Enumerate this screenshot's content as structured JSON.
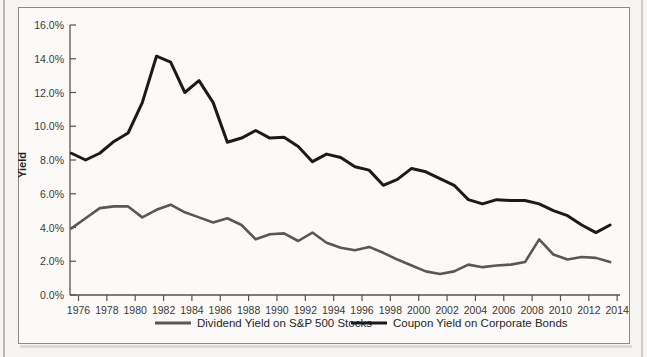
{
  "chart_data": {
    "type": "line",
    "title": "",
    "xlabel": "",
    "ylabel": "Yield",
    "xlim": [
      1975.4,
      2014.2
    ],
    "ylim": [
      0,
      16
    ],
    "grid": false,
    "legend_position": "bottom",
    "y_tick_labels": [
      "0.0%",
      "2.0%",
      "4.0%",
      "6.0%",
      "8.0%",
      "10.0%",
      "12.0%",
      "14.0%",
      "16.0%"
    ],
    "y_tick_values": [
      0,
      2,
      4,
      6,
      8,
      10,
      12,
      14,
      16
    ],
    "x_tick_labels": [
      "1976",
      "1978",
      "1980",
      "1982",
      "1984",
      "1986",
      "1988",
      "1990",
      "1992",
      "1994",
      "1996",
      "1998",
      "2000",
      "2002",
      "2004",
      "2006",
      "2008",
      "2010",
      "2012",
      "2014"
    ],
    "x_tick_values": [
      1976,
      1978,
      1980,
      1982,
      1984,
      1986,
      1988,
      1990,
      1992,
      1994,
      1996,
      1998,
      2000,
      2002,
      2004,
      2006,
      2008,
      2010,
      2012,
      2014
    ],
    "x": [
      1975.5,
      1976.5,
      1977.5,
      1978.5,
      1979.5,
      1980.5,
      1981.5,
      1982.5,
      1983.5,
      1984.5,
      1985.5,
      1986.5,
      1987.5,
      1988.5,
      1989.5,
      1990.5,
      1991.5,
      1992.5,
      1993.5,
      1994.5,
      1995.5,
      1996.5,
      1997.5,
      1998.5,
      1999.5,
      2000.5,
      2001.5,
      2002.5,
      2003.5,
      2004.5,
      2005.5,
      2006.5,
      2007.5,
      2008.5,
      2009.5,
      2010.5,
      2011.5,
      2012.5,
      2013.5
    ],
    "series": [
      {
        "name": "Dividend Yield on S&P 500 Stocks",
        "color": "#5a5854",
        "linewidth": 2.6,
        "values": [
          3.95,
          4.55,
          5.15,
          5.25,
          5.25,
          4.6,
          5.05,
          5.35,
          4.9,
          4.6,
          4.3,
          4.55,
          4.15,
          3.3,
          3.6,
          3.65,
          3.2,
          3.7,
          3.1,
          2.8,
          2.65,
          2.85,
          2.5,
          2.1,
          1.75,
          1.4,
          1.25,
          1.4,
          1.8,
          1.65,
          1.75,
          1.8,
          1.95,
          3.3,
          2.4,
          2.1,
          2.25,
          2.2,
          1.95
        ]
      },
      {
        "name": "Coupon Yield on Corporate Bonds",
        "color": "#1c1a18",
        "linewidth": 3.0,
        "values": [
          8.4,
          8.0,
          8.4,
          9.1,
          9.6,
          11.4,
          14.15,
          13.8,
          12.0,
          12.7,
          11.4,
          9.05,
          9.3,
          9.75,
          9.3,
          9.35,
          8.8,
          7.9,
          8.35,
          8.15,
          7.6,
          7.4,
          6.5,
          6.85,
          7.5,
          7.3,
          6.9,
          6.5,
          5.65,
          5.4,
          5.65,
          5.6,
          5.6,
          5.4,
          5.0,
          4.7,
          4.15,
          3.7,
          4.15
        ]
      }
    ],
    "legend": [
      {
        "label": "Dividend Yield on S&P 500 Stocks",
        "color": "#5a5854"
      },
      {
        "label": "Coupon Yield on Corporate Bonds",
        "color": "#1c1a18"
      }
    ]
  }
}
